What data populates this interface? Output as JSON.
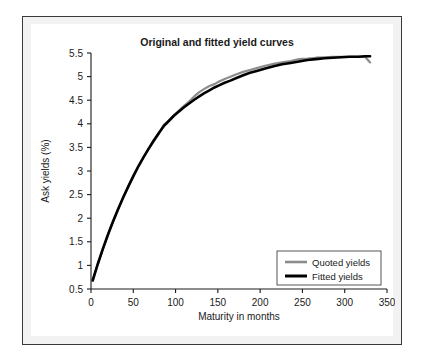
{
  "chart_data": {
    "type": "line",
    "title": "Original and fitted yield curves",
    "xlabel": "Maturity in months",
    "ylabel": "Ask yields (%)",
    "xlim": [
      0,
      350
    ],
    "ylim": [
      0.5,
      5.5
    ],
    "xticks": [
      0,
      50,
      100,
      150,
      200,
      250,
      300,
      350
    ],
    "xtick_labels": [
      "0",
      "50",
      "100",
      "150",
      "200",
      "250",
      "300",
      "350"
    ],
    "yticks": [
      0.5,
      1,
      1.5,
      2,
      2.5,
      3,
      3.5,
      4,
      4.5,
      5,
      5.5
    ],
    "ytick_labels": [
      "0.5",
      "1",
      "1.5",
      "2",
      "2.5",
      "3",
      "3.5",
      "4",
      "4.5",
      "5",
      "5.5"
    ],
    "grid": false,
    "legend_position": "lower right",
    "series": [
      {
        "name": "Quoted yields",
        "color": "#8c8c8c",
        "x": [
          2,
          8,
          14,
          20,
          26,
          32,
          38,
          44,
          50,
          56,
          62,
          68,
          74,
          80,
          86,
          92,
          98,
          104,
          110,
          116,
          122,
          128,
          134,
          140,
          146,
          152,
          158,
          164,
          172,
          180,
          188,
          196,
          206,
          216,
          226,
          236,
          246,
          256,
          266,
          276,
          286,
          296,
          306,
          316,
          324,
          330
        ],
        "y": [
          0.68,
          1.02,
          1.34,
          1.64,
          1.92,
          2.18,
          2.43,
          2.66,
          2.88,
          3.09,
          3.28,
          3.46,
          3.62,
          3.78,
          3.98,
          4.07,
          4.18,
          4.28,
          4.38,
          4.47,
          4.58,
          4.67,
          4.74,
          4.8,
          4.84,
          4.9,
          4.95,
          4.99,
          5.05,
          5.1,
          5.14,
          5.18,
          5.23,
          5.27,
          5.3,
          5.33,
          5.37,
          5.38,
          5.4,
          5.41,
          5.42,
          5.42,
          5.42,
          5.42,
          5.42,
          5.3
        ]
      },
      {
        "name": "Fitted yields",
        "color": "#000000",
        "x": [
          2,
          8,
          14,
          20,
          26,
          32,
          38,
          44,
          50,
          56,
          62,
          68,
          74,
          80,
          86,
          92,
          98,
          104,
          110,
          116,
          122,
          128,
          134,
          140,
          146,
          152,
          158,
          164,
          172,
          180,
          188,
          196,
          206,
          216,
          226,
          236,
          246,
          256,
          266,
          276,
          286,
          296,
          306,
          316,
          324,
          330
        ],
        "y": [
          0.68,
          1.03,
          1.35,
          1.65,
          1.93,
          2.19,
          2.44,
          2.67,
          2.89,
          3.1,
          3.29,
          3.47,
          3.64,
          3.8,
          3.95,
          4.06,
          4.17,
          4.26,
          4.35,
          4.43,
          4.51,
          4.58,
          4.65,
          4.71,
          4.77,
          4.82,
          4.87,
          4.91,
          4.97,
          5.03,
          5.08,
          5.12,
          5.17,
          5.22,
          5.26,
          5.29,
          5.32,
          5.35,
          5.37,
          5.39,
          5.4,
          5.41,
          5.42,
          5.42,
          5.43,
          5.43
        ]
      }
    ]
  },
  "legend": {
    "items": [
      {
        "label": "Quoted yields"
      },
      {
        "label": "Fitted yields"
      }
    ]
  },
  "colors": {
    "quoted": "#8c8c8c",
    "fitted": "#000000",
    "frame_border": "#3a3a3a",
    "plate_background": "#ffffff"
  }
}
